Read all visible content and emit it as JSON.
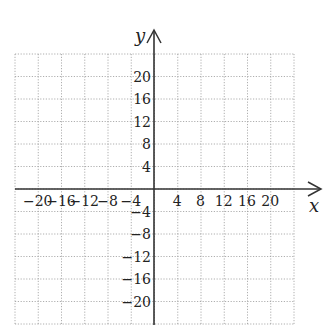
{
  "plane": {
    "x_axis_label": "x",
    "y_axis_label": "y",
    "x_ticks": [
      "-20",
      "-16",
      "-12",
      "-8",
      "-4",
      "4",
      "8",
      "12",
      "16",
      "20"
    ],
    "y_ticks": [
      "20",
      "16",
      "12",
      "8",
      "4",
      "-4",
      "-8",
      "-12",
      "-16",
      "-20"
    ],
    "grid_step": 4,
    "range": [
      -24,
      24
    ],
    "colors": {
      "axis": "#333333",
      "grid": "#9a9a9a",
      "text": "#222222"
    }
  }
}
